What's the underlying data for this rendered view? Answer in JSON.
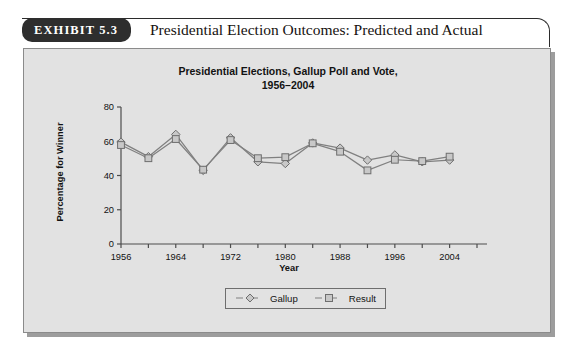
{
  "exhibit": {
    "badge_label": "EXHIBIT 5.3",
    "title": "Presidential Election Outcomes: Predicted and Actual"
  },
  "chart_data": {
    "type": "line",
    "title": "Presidential Elections, Gallup Poll and Vote,\n1956–2004",
    "title_line1": "Presidential Elections, Gallup Poll and Vote,",
    "title_line2": "1956–2004",
    "xlabel": "Year",
    "ylabel": "Percentage for Winner",
    "xlim": [
      1956,
      2008
    ],
    "ylim": [
      0,
      80
    ],
    "yticks": [
      0,
      20,
      40,
      60,
      80
    ],
    "xticks": [
      1956,
      1960,
      1964,
      1968,
      1972,
      1976,
      1980,
      1984,
      1988,
      1992,
      1996,
      2000,
      2004,
      2008
    ],
    "xticklabels": [
      "1956",
      "1964",
      "1972",
      "1980",
      "1988",
      "1996",
      "2004"
    ],
    "xticklabel_values": [
      1956,
      1964,
      1972,
      1980,
      1988,
      1996,
      2004
    ],
    "grid": false,
    "legend_position": "below-center",
    "x": [
      1956,
      1960,
      1964,
      1968,
      1972,
      1976,
      1980,
      1984,
      1988,
      1992,
      1996,
      2000,
      2004
    ],
    "series": [
      {
        "name": "Gallup",
        "marker": "diamond",
        "values": [
          59.5,
          51,
          64,
          43,
          62,
          48,
          47,
          59,
          56,
          49,
          52,
          48,
          49
        ]
      },
      {
        "name": "Result",
        "marker": "square",
        "values": [
          57.8,
          50.1,
          61.3,
          43.4,
          60.7,
          50.1,
          50.7,
          58.8,
          53.9,
          43,
          49.2,
          48.4,
          51
        ]
      }
    ]
  },
  "legend": {
    "items": [
      {
        "label": "Gallup",
        "marker": "diamond-icon"
      },
      {
        "label": "Result",
        "marker": "square-icon"
      }
    ]
  },
  "colors": {
    "panel_background": "#e2e2e2",
    "line": "#808080",
    "marker_fill": "#c8c8c8",
    "axis": "#4d4d4d",
    "badge_background": "#2e2e2e",
    "text": "#121212"
  }
}
